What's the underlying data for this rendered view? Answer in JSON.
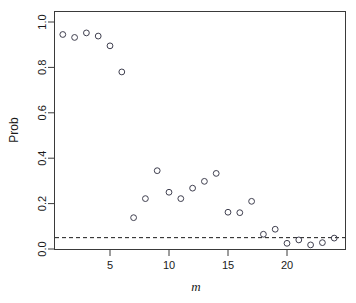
{
  "chart_data": {
    "type": "scatter",
    "title": "",
    "xlabel": "m",
    "ylabel": "Prob",
    "x": [
      1,
      2,
      3,
      4,
      5,
      6,
      7,
      8,
      9,
      10,
      11,
      12,
      13,
      14,
      15,
      16,
      17,
      18,
      19,
      20,
      21,
      22,
      23,
      24
    ],
    "values": [
      0.945,
      0.932,
      0.952,
      0.938,
      0.895,
      0.78,
      0.138,
      0.222,
      0.345,
      0.25,
      0.222,
      0.268,
      0.298,
      0.333,
      0.162,
      0.16,
      0.21,
      0.065,
      0.087,
      0.025,
      0.04,
      0.018,
      0.028,
      0.048
    ],
    "series": [
      {
        "name": "Prob",
        "marker": "open-circle",
        "values": [
          0.945,
          0.932,
          0.952,
          0.938,
          0.895,
          0.78,
          0.138,
          0.222,
          0.345,
          0.25,
          0.222,
          0.268,
          0.298,
          0.333,
          0.162,
          0.16,
          0.21,
          0.065,
          0.087,
          0.025,
          0.04,
          0.018,
          0.028,
          0.048
        ]
      }
    ],
    "xlim": [
      0.4,
      24.6
    ],
    "ylim": [
      -0.02,
      1.02
    ],
    "xticks": [
      5,
      10,
      15,
      20
    ],
    "xtick_labels": [
      "5",
      "10",
      "15",
      "20"
    ],
    "yticks": [
      0.0,
      0.2,
      0.4,
      0.6,
      0.8,
      1.0
    ],
    "ytick_labels": [
      "0.0",
      "0.2",
      "0.4",
      "0.6",
      "0.8",
      "1.0"
    ],
    "grid": false,
    "legend": null,
    "annotations": [
      {
        "type": "hline",
        "name": "significance-threshold",
        "y": 0.05,
        "style": "dashed",
        "label": ""
      }
    ]
  },
  "axes": {
    "y_title": "Prob",
    "x_title": "m"
  }
}
